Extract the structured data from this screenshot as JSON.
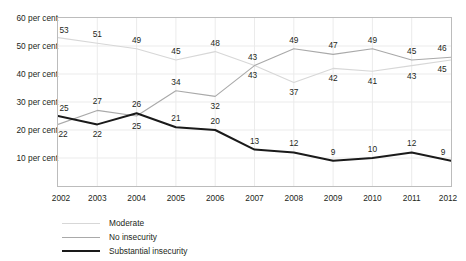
{
  "chart_data": {
    "type": "line",
    "title": "",
    "xlabel": "",
    "ylabel": "",
    "x": [
      2002,
      2003,
      2004,
      2005,
      2006,
      2007,
      2008,
      2009,
      2010,
      2011,
      2012
    ],
    "categories": [
      "2002",
      "2003",
      "2004",
      "2005",
      "2006",
      "2007",
      "2008",
      "2009",
      "2010",
      "2011",
      "2012"
    ],
    "ylim": [
      0,
      60
    ],
    "yticks": [
      10,
      20,
      30,
      40,
      50,
      60
    ],
    "ytick_labels": [
      "10 per cent",
      "20 per cent",
      "30 per cent",
      "40 per cent",
      "50 per cent",
      "60 per cent"
    ],
    "grid": true,
    "legend_position": "bottom-left",
    "series": [
      {
        "name": "Moderate",
        "color": "#d7d7d7",
        "width": 1.1,
        "values": [
          53,
          51,
          49,
          45,
          48,
          43,
          37,
          42,
          41,
          43,
          45
        ],
        "labels": [
          "53",
          "51",
          "49",
          "45",
          "48",
          "43",
          "37",
          "42",
          "41",
          "43",
          "45"
        ]
      },
      {
        "name": "No insecurity",
        "color": "#a9a9a9",
        "width": 1.1,
        "values": [
          22,
          27,
          25,
          34,
          32,
          43,
          49,
          47,
          49,
          45,
          46
        ],
        "labels": [
          "22",
          "27",
          "25",
          "34",
          "32",
          "43",
          "49",
          "47",
          "49",
          "45",
          "46"
        ]
      },
      {
        "name": "Substantial insecurity",
        "color": "#1a1a1a",
        "width": 2.0,
        "values": [
          25,
          22,
          26,
          21,
          20,
          13,
          12,
          9,
          10,
          12,
          9
        ],
        "labels": [
          "25",
          "22",
          "26",
          "21",
          "20",
          "13",
          "12",
          "9",
          "10",
          "12",
          "9"
        ]
      }
    ],
    "point_labels": [
      {
        "series": "Moderate",
        "x": 2002,
        "text": "53",
        "dx": 6,
        "dy": -8
      },
      {
        "series": "Moderate",
        "x": 2003,
        "text": "51",
        "dx": 0,
        "dy": -9
      },
      {
        "series": "Moderate",
        "x": 2004,
        "text": "49",
        "dx": 0,
        "dy": -9
      },
      {
        "series": "Moderate",
        "x": 2005,
        "text": "45",
        "dx": 0,
        "dy": -9
      },
      {
        "series": "Moderate",
        "x": 2006,
        "text": "48",
        "dx": 0,
        "dy": -9
      },
      {
        "series": "Moderate",
        "x": 2007,
        "text": "43",
        "dx": -2,
        "dy": 9
      },
      {
        "series": "Moderate",
        "x": 2008,
        "text": "37",
        "dx": 0,
        "dy": 10
      },
      {
        "series": "Moderate",
        "x": 2009,
        "text": "42",
        "dx": 0,
        "dy": 10
      },
      {
        "series": "Moderate",
        "x": 2010,
        "text": "41",
        "dx": 0,
        "dy": 10
      },
      {
        "series": "Moderate",
        "x": 2011,
        "text": "43",
        "dx": 0,
        "dy": 10
      },
      {
        "series": "Moderate",
        "x": 2012,
        "text": "45",
        "dx": -9,
        "dy": 9
      },
      {
        "series": "No insecurity",
        "x": 2002,
        "text": "22",
        "dx": 5,
        "dy": 10
      },
      {
        "series": "No insecurity",
        "x": 2003,
        "text": "27",
        "dx": 0,
        "dy": -9
      },
      {
        "series": "No insecurity",
        "x": 2004,
        "text": "25",
        "dx": 0,
        "dy": 10
      },
      {
        "series": "No insecurity",
        "x": 2005,
        "text": "34",
        "dx": 0,
        "dy": -9
      },
      {
        "series": "No insecurity",
        "x": 2006,
        "text": "32",
        "dx": 0,
        "dy": 10
      },
      {
        "series": "No insecurity",
        "x": 2007,
        "text": "43",
        "dx": -2,
        "dy": -9
      },
      {
        "series": "No insecurity",
        "x": 2008,
        "text": "49",
        "dx": 0,
        "dy": -9
      },
      {
        "series": "No insecurity",
        "x": 2009,
        "text": "47",
        "dx": 0,
        "dy": -9
      },
      {
        "series": "No insecurity",
        "x": 2010,
        "text": "49",
        "dx": 0,
        "dy": -9
      },
      {
        "series": "No insecurity",
        "x": 2011,
        "text": "45",
        "dx": 0,
        "dy": -9
      },
      {
        "series": "No insecurity",
        "x": 2012,
        "text": "46",
        "dx": -9,
        "dy": -9
      },
      {
        "series": "Substantial insecurity",
        "x": 2002,
        "text": "25",
        "dx": 6,
        "dy": -8
      },
      {
        "series": "Substantial insecurity",
        "x": 2003,
        "text": "22",
        "dx": 0,
        "dy": 10
      },
      {
        "series": "Substantial insecurity",
        "x": 2004,
        "text": "26",
        "dx": 0,
        "dy": -9
      },
      {
        "series": "Substantial insecurity",
        "x": 2005,
        "text": "21",
        "dx": 0,
        "dy": -9
      },
      {
        "series": "Substantial insecurity",
        "x": 2006,
        "text": "20",
        "dx": 0,
        "dy": -9
      },
      {
        "series": "Substantial insecurity",
        "x": 2007,
        "text": "13",
        "dx": 0,
        "dy": -9
      },
      {
        "series": "Substantial insecurity",
        "x": 2008,
        "text": "12",
        "dx": 0,
        "dy": -9
      },
      {
        "series": "Substantial insecurity",
        "x": 2009,
        "text": "9",
        "dx": 0,
        "dy": -9
      },
      {
        "series": "Substantial insecurity",
        "x": 2010,
        "text": "10",
        "dx": 0,
        "dy": -9
      },
      {
        "series": "Substantial insecurity",
        "x": 2011,
        "text": "12",
        "dx": 0,
        "dy": -9
      },
      {
        "series": "Substantial insecurity",
        "x": 2012,
        "text": "9",
        "dx": -8,
        "dy": -9
      }
    ]
  },
  "axes": {
    "y_labels": [
      "60 per cent",
      "50 per cent",
      "40 per cent",
      "30 per cent",
      "20 per cent",
      "10 per cent"
    ],
    "x_labels": [
      "2002",
      "2003",
      "2004",
      "2005",
      "2006",
      "2007",
      "2008",
      "2009",
      "2010",
      "2011",
      "2012"
    ]
  },
  "legend": {
    "items": [
      {
        "label": "Moderate",
        "color": "#d7d7d7",
        "width": 1.2
      },
      {
        "label": "No insecurity",
        "color": "#a9a9a9",
        "width": 1.2
      },
      {
        "label": "Substantial insecurity",
        "color": "#1a1a1a",
        "width": 2.2
      }
    ]
  },
  "clipped_header": {
    "text": ""
  },
  "colors": {
    "plot_border": "#bcbcbc",
    "gridline": "#ebebeb",
    "text": "#231f20",
    "background": "#ffffff"
  }
}
